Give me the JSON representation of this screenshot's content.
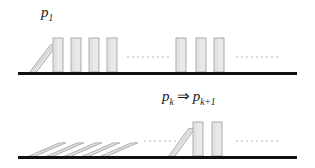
{
  "figure": {
    "width": 315,
    "height": 168,
    "background_color": "#ffffff"
  },
  "colors": {
    "domino_fill": "#e9e9e9",
    "domino_stroke": "#9a9a9a",
    "domino_shade": "#d6d6d6",
    "ground_line": "#111111",
    "ellipsis_dot": "#c9c9c9",
    "label_text": "#1a1a1a"
  },
  "panels": [
    {
      "id": "base-case",
      "label": {
        "base": "p",
        "subscript": "1",
        "plain_text": "p1"
      },
      "ground": {
        "x": 18,
        "y": 72,
        "width": 279,
        "thickness": 3
      },
      "dominoes": [
        {
          "index": 1,
          "state": "tipping",
          "tilt_deg": 37,
          "x": 29,
          "width": 10,
          "height": 34
        },
        {
          "index": 2,
          "state": "upright",
          "tilt_deg": 0,
          "x": 53,
          "width": 10,
          "height": 34
        },
        {
          "index": 3,
          "state": "upright",
          "tilt_deg": 0,
          "x": 71,
          "width": 10,
          "height": 34
        },
        {
          "index": 4,
          "state": "upright",
          "tilt_deg": 0,
          "x": 89,
          "width": 10,
          "height": 34
        },
        {
          "index": 5,
          "state": "upright",
          "tilt_deg": 0,
          "x": 107,
          "width": 10,
          "height": 34
        },
        {
          "index": 6,
          "state": "upright",
          "tilt_deg": 0,
          "x": 176,
          "width": 10,
          "height": 34
        },
        {
          "index": 7,
          "state": "upright",
          "tilt_deg": 0,
          "x": 196,
          "width": 10,
          "height": 34
        },
        {
          "index": 8,
          "state": "upright",
          "tilt_deg": 0,
          "x": 214,
          "width": 10,
          "height": 34
        }
      ],
      "ellipses": [
        {
          "x": 128,
          "y": 57,
          "count": 9,
          "spacing": 5
        },
        {
          "x": 237,
          "y": 57,
          "count": 9,
          "spacing": 5
        }
      ]
    },
    {
      "id": "inductive-step",
      "label": {
        "base": "p",
        "subscript": "k",
        "operator": "⇒",
        "base2": "p",
        "subscript2": "k+1",
        "plain_text": "pk ⇒ pk+1"
      },
      "ground": {
        "x": 18,
        "y": 72,
        "width": 279,
        "thickness": 3
      },
      "dominoes": [
        {
          "index": 1,
          "state": "fallen",
          "tilt_deg": 64,
          "x": 28,
          "width": 10,
          "height": 34
        },
        {
          "index": 2,
          "state": "fallen",
          "tilt_deg": 64,
          "x": 46,
          "width": 10,
          "height": 34
        },
        {
          "index": 3,
          "state": "fallen",
          "tilt_deg": 64,
          "x": 64,
          "width": 10,
          "height": 34
        },
        {
          "index": 4,
          "state": "fallen",
          "tilt_deg": 64,
          "x": 82,
          "width": 10,
          "height": 34
        },
        {
          "index": 5,
          "state": "fallen",
          "tilt_deg": 64,
          "x": 100,
          "width": 10,
          "height": 34
        },
        {
          "index": 6,
          "state": "tipping",
          "tilt_deg": 34,
          "x": 168,
          "width": 10,
          "height": 34
        },
        {
          "index": 7,
          "state": "upright",
          "tilt_deg": 0,
          "x": 193,
          "width": 10,
          "height": 34
        },
        {
          "index": 8,
          "state": "upright",
          "tilt_deg": 0,
          "x": 212,
          "width": 10,
          "height": 34
        }
      ],
      "ellipses": [
        {
          "x": 145,
          "y": 57,
          "count": 7,
          "spacing": 5
        },
        {
          "x": 237,
          "y": 57,
          "count": 9,
          "spacing": 5
        }
      ]
    }
  ]
}
